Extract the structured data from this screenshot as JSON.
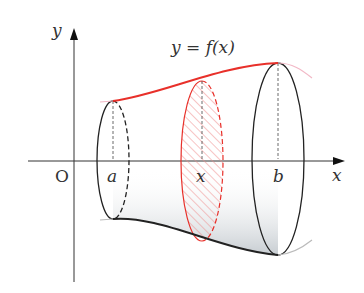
{
  "diagram": {
    "type": "solid-of-revolution",
    "axes": {
      "x_label": "x",
      "y_label": "y",
      "origin_label": "O"
    },
    "function_label": "y = f(x)",
    "points": {
      "a_label": "a",
      "x_label": "x",
      "b_label": "b"
    },
    "colors": {
      "curve": "#e8302a",
      "curve_extension": "#f2b8c6",
      "cross_section": "#e8302a",
      "hatch": "#f08a8a",
      "outline": "#222222",
      "surface_shade": "#c9ced2"
    }
  }
}
